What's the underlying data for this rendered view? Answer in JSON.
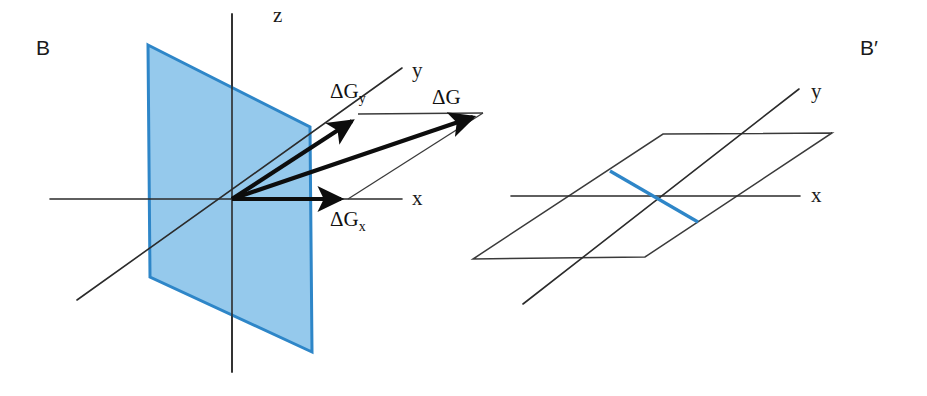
{
  "figure": {
    "width": 927,
    "height": 396,
    "background": "#ffffff",
    "colors": {
      "plane_fill": "#95c9ec",
      "plane_stroke": "#2e86c8",
      "axis": "#2b2b2b",
      "vector": "#0d0d0d",
      "outline": "#3a3a3a",
      "text": "#1a1a1a"
    }
  },
  "panels": [
    {
      "id": "left",
      "letter": "B",
      "letter_pos": {
        "x": 36,
        "y": 55
      },
      "description": "Vertical yz-plane in 3D axes with free-energy gradient vector decomposition",
      "origin": {
        "x": 232,
        "y": 199
      },
      "axes": [
        {
          "name": "z",
          "label": "z",
          "label_pos": {
            "x": 273,
            "y": 22
          },
          "line": {
            "x1": 232,
            "y1": 14,
            "x2": 232,
            "y2": 372
          }
        },
        {
          "name": "x",
          "label": "x",
          "label_pos": {
            "x": 412,
            "y": 205
          },
          "line": {
            "x1": 50,
            "y1": 199,
            "x2": 402,
            "y2": 199
          }
        },
        {
          "name": "y",
          "label": "y",
          "label_pos": {
            "x": 412,
            "y": 77
          },
          "line": {
            "x1": 77,
            "y1": 300,
            "x2": 402,
            "y2": 68
          }
        }
      ],
      "plane": {
        "name": "yz-plane",
        "points": "148,45 310,127 312,352 150,277"
      },
      "vectors": [
        {
          "name": "delta-G-y",
          "label": "ΔG",
          "subscript": "y",
          "label_pos": {
            "x": 330,
            "y": 98
          },
          "from": {
            "x": 232,
            "y": 199
          },
          "to": {
            "x": 360,
            "y": 116
          }
        },
        {
          "name": "delta-G",
          "label": "ΔG",
          "subscript": "",
          "label_pos": {
            "x": 432,
            "y": 104
          },
          "from": {
            "x": 232,
            "y": 199
          },
          "to": {
            "x": 483,
            "y": 113
          }
        },
        {
          "name": "delta-G-x",
          "label": "ΔG",
          "subscript": "x",
          "label_pos": {
            "x": 330,
            "y": 226
          },
          "from": {
            "x": 232,
            "y": 199
          },
          "to": {
            "x": 350,
            "y": 199
          }
        }
      ],
      "guides": [
        {
          "name": "guide-top",
          "x1": 360,
          "y1": 114,
          "x2": 483,
          "y2": 113
        },
        {
          "name": "guide-diagonal",
          "x1": 350,
          "y1": 199,
          "x2": 483,
          "y2": 113
        }
      ]
    },
    {
      "id": "right",
      "letter": "B′",
      "letter_pos": {
        "x": 860,
        "y": 55
      },
      "description": "Horizontal xy-plane viewed obliquely with blue intersection segment",
      "origin": {
        "x": 653,
        "y": 196
      },
      "axes": [
        {
          "name": "x",
          "label": "x",
          "label_pos": {
            "x": 811,
            "y": 202
          },
          "line": {
            "x1": 511,
            "y1": 196,
            "x2": 800,
            "y2": 196
          }
        },
        {
          "name": "y",
          "label": "y",
          "label_pos": {
            "x": 811,
            "y": 98
          },
          "line": {
            "x1": 523,
            "y1": 304,
            "x2": 799,
            "y2": 89
          }
        }
      ],
      "plane": {
        "name": "xy-plane",
        "points": "663,134 832,133 645,257 473,259"
      },
      "blue_segment": {
        "name": "intersection-segment",
        "x1": 610,
        "y1": 171,
        "x2": 698,
        "y2": 222
      }
    }
  ]
}
